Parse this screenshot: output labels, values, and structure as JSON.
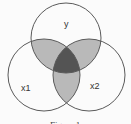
{
  "diagram": {
    "type": "venn",
    "sets": [
      {
        "id": "y",
        "label": "y"
      },
      {
        "id": "x1",
        "label": "x1"
      },
      {
        "id": "x2",
        "label": "x2"
      }
    ],
    "shading": {
      "pairwise_overlap": "#b9b9b9",
      "triple_overlap": "#545454",
      "single_region": "#fbfbfb",
      "stroke": "#5a5a5a"
    },
    "caption": "Figure 1"
  }
}
